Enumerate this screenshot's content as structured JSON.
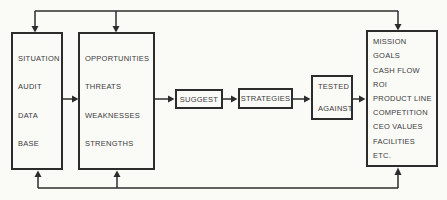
{
  "diagram": {
    "background_color": "#fafaf7",
    "line_color": "#2c2c2c",
    "text_color": "#3b3b3b",
    "boxes": {
      "situation_audit": {
        "lines": [
          "SITUATION",
          "AUDIT",
          "DATA",
          "BASE"
        ]
      },
      "swot": {
        "lines": [
          "OPPORTUNITIES",
          "THREATS",
          "WEAKNESSES",
          "STRENGTHS"
        ]
      },
      "suggest": {
        "label": "SUGGEST"
      },
      "strategies": {
        "label": "STRATEGIES"
      },
      "tested_against": {
        "lines": [
          "TESTED",
          "AGAINST"
        ]
      },
      "evaluation_criteria": {
        "lines": [
          "MISSION",
          "GOALS",
          "CASH FLOW",
          "ROI",
          "PRODUCT LINE",
          "COMPETITION",
          "CEO VALUES",
          "FACILITIES",
          "ETC."
        ]
      }
    }
  }
}
